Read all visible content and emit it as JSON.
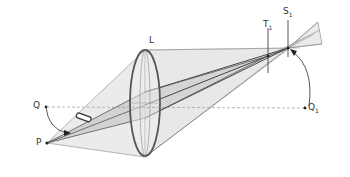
{
  "diagram": {
    "title": "",
    "labels": {
      "lens": "L",
      "point_p": "P",
      "point_q": "Q",
      "image_q1_main": "Q",
      "image_q1_sub": "1",
      "plane_t1_main": "T",
      "plane_t1_sub": "1",
      "plane_s1_main": "S",
      "plane_s1_sub": "1"
    },
    "colors": {
      "line": "#555555",
      "cone_fill": "#d9d9d9",
      "inner_fill": "#bdbdbd",
      "lens_stroke": "#555555",
      "dashed": "#999999"
    }
  }
}
